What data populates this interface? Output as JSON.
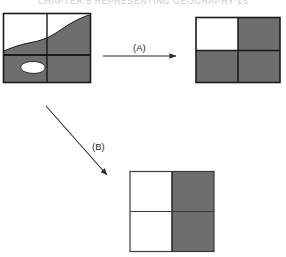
{
  "page": {
    "header_text": "CHAPTER 5  REPRESENTING GEOGRAPHY    15",
    "background": "#ffffff"
  },
  "colors": {
    "fill_gray": "#6e6e6e",
    "fill_white": "#ffffff",
    "stroke_dark": "#1a1a1a",
    "stroke_thin": "#3a3a3a",
    "arrow": "#2b2b2b",
    "header_text": "#c9c9c9"
  },
  "figure": {
    "panels": [
      {
        "id": "source-map",
        "name": "source-vector-map",
        "role": "input",
        "position": {
          "x": 3,
          "y": 13,
          "width": 88,
          "height": 70
        },
        "grid": {
          "rows": 2,
          "cols": 2
        },
        "description": "Irregular polygon boundary overlaid on a 2 by 2 cell grid",
        "cells": [
          {
            "row": 0,
            "col": 0,
            "label": "mostly-white",
            "gray_fraction": 0.3
          },
          {
            "row": 0,
            "col": 1,
            "label": "mostly-gray",
            "gray_fraction": 0.78
          },
          {
            "row": 1,
            "col": 0,
            "label": "gray-with-white-island",
            "gray_fraction": 0.8
          },
          {
            "row": 1,
            "col": 1,
            "label": "all-gray",
            "gray_fraction": 1.0
          }
        ]
      },
      {
        "id": "result-a",
        "name": "largest-share-raster",
        "role": "output",
        "position": {
          "x": 196,
          "y": 17,
          "width": 84,
          "height": 66
        },
        "grid": {
          "rows": 2,
          "cols": 2
        },
        "description": "Raster produced by the largest-share rule",
        "cells": [
          {
            "row": 0,
            "col": 0,
            "fill": "white"
          },
          {
            "row": 0,
            "col": 1,
            "fill": "gray"
          },
          {
            "row": 1,
            "col": 0,
            "fill": "gray"
          },
          {
            "row": 1,
            "col": 1,
            "fill": "gray"
          }
        ]
      },
      {
        "id": "result-b",
        "name": "central-point-raster",
        "role": "output",
        "position": {
          "x": 130,
          "y": 171,
          "width": 84,
          "height": 81
        },
        "grid": {
          "rows": 2,
          "cols": 2
        },
        "description": "Raster produced by the central-point rule",
        "cells": [
          {
            "row": 0,
            "col": 0,
            "fill": "white"
          },
          {
            "row": 0,
            "col": 1,
            "fill": "gray"
          },
          {
            "row": 1,
            "col": 0,
            "fill": "white"
          },
          {
            "row": 1,
            "col": 1,
            "fill": "gray"
          }
        ]
      }
    ],
    "arrows": [
      {
        "id": "arrow-a",
        "name": "transform-arrow-a",
        "label": "(A)",
        "from": "source-map",
        "to": "result-a",
        "orientation": "horizontal",
        "x1": 103,
        "y1": 56,
        "x2": 181,
        "y2": 56,
        "label_x": 133,
        "label_y": 42
      },
      {
        "id": "arrow-b",
        "name": "transform-arrow-b",
        "label": "(B)",
        "from": "source-map",
        "to": "result-b",
        "orientation": "diagonal",
        "x1": 46,
        "y1": 106,
        "x2": 110,
        "y2": 178,
        "label_x": 92,
        "label_y": 141
      }
    ]
  }
}
